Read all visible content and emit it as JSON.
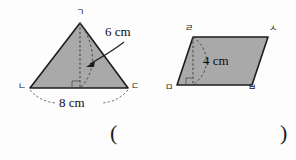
{
  "figures": {
    "triangle": {
      "name": "triangle-figure",
      "vertex_labels": {
        "apex": "ㄱ",
        "bottom_left": "ㄴ",
        "bottom_right": "ㄷ"
      },
      "height_label": "6 cm",
      "base_label": "8 cm",
      "fill_color": "#a9a9a9",
      "stroke_color": "#1c1c1c",
      "points": {
        "apex": [
          80,
          23
        ],
        "bottom_left": [
          30,
          88
        ],
        "bottom_right": [
          128,
          88
        ]
      },
      "height_foot": [
        80,
        88
      ],
      "right_angle_mark": true
    },
    "parallelogram": {
      "name": "parallelogram-figure",
      "vertex_labels": {
        "top_left": "ㄹ",
        "top_right": "ㅅ",
        "bottom_left": "ㅁ",
        "bottom_right": "ㅂ"
      },
      "height_label": "4 cm",
      "fill_color": "#a9a9a9",
      "stroke_color": "#1c1c1c",
      "points": {
        "top_left": [
          193,
          37
        ],
        "top_right": [
          268,
          37
        ],
        "bottom_right": [
          252,
          85
        ],
        "bottom_left": [
          177,
          85
        ]
      },
      "height_top": [
        193,
        37
      ],
      "height_foot": [
        193,
        85
      ],
      "right_angle_mark": true
    }
  },
  "answer_slot": {
    "open_paren": "(",
    "close_paren": ")"
  }
}
